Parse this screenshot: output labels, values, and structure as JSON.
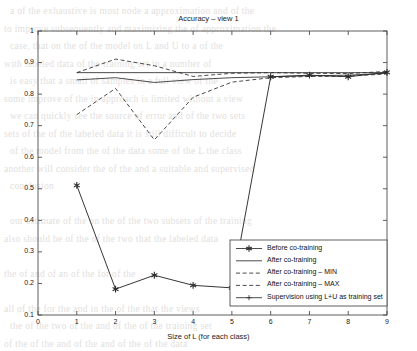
{
  "figure": {
    "background_color": "#ffffff",
    "axis_color": "#4d4d4d",
    "line_color": "#2b2b2b"
  },
  "chart_data": {
    "type": "line",
    "title": "Accuracy – view 1",
    "xlabel": "Size of L (for each class)",
    "ylabel": "",
    "xlim": [
      0,
      9
    ],
    "ylim": [
      0.1,
      1
    ],
    "grid": false,
    "legend_position": "lower right",
    "x_ticks": [
      "0",
      "1",
      "2",
      "3",
      "4",
      "5",
      "6",
      "7",
      "8",
      "9"
    ],
    "y_ticks": [
      "0.1",
      "0.2",
      "0.3",
      "0.4",
      "0.5",
      "0.6",
      "0.7",
      "0.8",
      "0.9",
      "1"
    ],
    "x": [
      1,
      2,
      3,
      4,
      5,
      6,
      7,
      8,
      9
    ],
    "series": [
      {
        "name": "Before co-training",
        "style": "solid-star",
        "values": [
          0.511,
          0.182,
          0.226,
          0.194,
          0.186,
          0.855,
          0.86,
          0.855,
          0.869
        ]
      },
      {
        "name": "After co-training",
        "style": "solid",
        "values": [
          0.845,
          0.852,
          0.837,
          0.846,
          0.852,
          0.855,
          0.858,
          0.86,
          0.866
        ]
      },
      {
        "name": "After co-training – MIN",
        "style": "dashed",
        "values": [
          0.735,
          0.818,
          0.655,
          0.79,
          0.838,
          0.852,
          0.856,
          0.857,
          0.864
        ]
      },
      {
        "name": "After co-training – MAX",
        "style": "dashed",
        "values": [
          0.868,
          0.911,
          0.89,
          0.856,
          0.866,
          0.868,
          0.866,
          0.865,
          0.872
        ]
      },
      {
        "name": "Supervision using L+U as training set",
        "style": "solid-plus",
        "values": [
          0.868,
          0.868,
          0.868,
          0.868,
          0.868,
          0.868,
          0.868,
          0.868,
          0.868
        ]
      }
    ]
  },
  "legend": {
    "items": [
      {
        "label": "Before co-training"
      },
      {
        "label": "After co-training"
      },
      {
        "label": "After co-training – MIN"
      },
      {
        "label": "After co-training – MAX"
      },
      {
        "label": "Supervision using L+U as training set"
      }
    ]
  },
  "background_text": {
    "lines": [
      "a  of  the  exhaustive  is  most  node  a  approximation  and  of  the",
      "to  improve  subsequently  and  maximizing  the  of  approximation  the",
      "case,  that  on  the  of  the  model  on  L  and  U  to  a  of  the",
      "with  labeled  data  of  the  training  set  in  a  number  of",
      "is  easy  that  a  small  of  samples  in  a  full  view  of  the",
      "some  improve  of  the  in  approach  is  limited  without  a  view",
      "we  can  quickly  see  the  source  of  error  and  of  the  two  sets",
      "sets  of  the  of  the  labeled  data  it  is  still  difficult  to  decide",
      "of  the  model  from  the  of  the  data  some  of  the  L  the  class",
      "another  will  consider  the  of  the  and  a  suitable  and  supervised",
      "conclusion",
      "",
      "our  estimate  of  the  on  the  of  the  two  subsets  of  the  training",
      "also  should  be  of  the  of  the  two  that  the  labeled  data",
      "",
      "the  of  and  of  an  of  the  for  of  the",
      "",
      "all  of  the  for  the  and  in  the  of  the  that  the  views",
      "the  of  the  two  of  the  and  of  the  of  the  training  set",
      "of  the  of  the  and  of  the  and  of  the  of  the  data"
    ]
  }
}
